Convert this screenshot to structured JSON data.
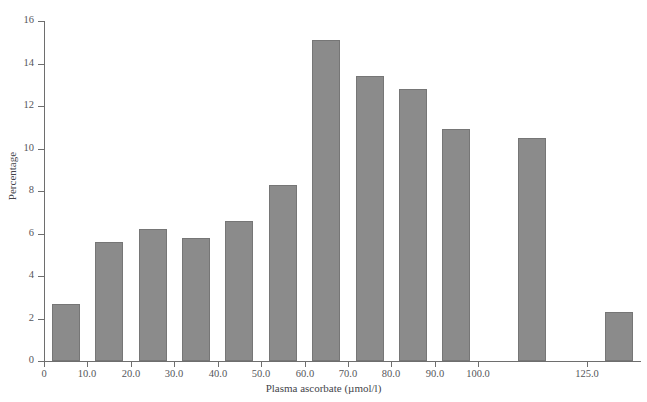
{
  "chart_data": {
    "type": "bar",
    "title": "",
    "xlabel": "Plasma ascorbate (µmol/l)",
    "ylabel": "Percentage",
    "categories": [
      "0-10",
      "10-20",
      "20-30",
      "30-40",
      "40-50",
      "50-60",
      "60-70",
      "70-80",
      "80-90",
      "90-100",
      "100-125",
      "125+"
    ],
    "bin_centers": [
      5,
      15,
      25,
      35,
      45,
      55,
      65,
      75,
      85,
      95,
      112.5,
      132.5
    ],
    "values": [
      2.7,
      5.6,
      6.2,
      5.8,
      6.6,
      8.3,
      15.1,
      13.4,
      12.8,
      10.9,
      10.5,
      2.3
    ],
    "xtick_labels": [
      "0",
      "10.0",
      "20.0",
      "30.0",
      "40.0",
      "50.0",
      "60.0",
      "70.0",
      "80.0",
      "90.0",
      "100.0",
      "125.0"
    ],
    "xtick_values": [
      0,
      10,
      20,
      30,
      40,
      50,
      60,
      70,
      80,
      90,
      100,
      125
    ],
    "ytick_labels": [
      "0",
      "2",
      "4",
      "6",
      "8",
      "10",
      "12",
      "14",
      "16"
    ],
    "ytick_values": [
      0,
      2,
      4,
      6,
      8,
      10,
      12,
      14,
      16
    ],
    "ylim": [
      0,
      16
    ],
    "xlim": [
      0,
      137.5
    ],
    "grid": false,
    "legend": false,
    "bar_color": "#8b8b8b",
    "bar_edge_color": "#767676",
    "axis_color": "#6e6e6e",
    "background_color": "#ffffff"
  },
  "figure": {
    "cut_title": "",
    "ylabel": "Percentage",
    "xlabel": "Plasma ascorbate (µmol/l)"
  }
}
